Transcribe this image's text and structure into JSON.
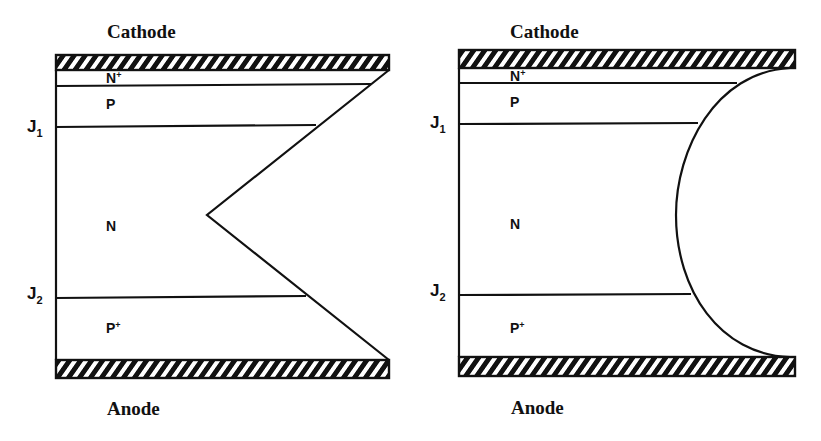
{
  "diagrams": [
    {
      "id": "bevel-positive-negative",
      "cathode_label": "Cathode",
      "anode_label": "Anode",
      "regions": {
        "n_plus": {
          "base": "N",
          "sup": "+"
        },
        "p": {
          "base": "P",
          "sup": ""
        },
        "n": {
          "base": "N",
          "sup": ""
        },
        "p_plus": {
          "base": "P",
          "sup": "+"
        }
      },
      "junctions": {
        "j1": {
          "base": "J",
          "sub": "1"
        },
        "j2": {
          "base": "J",
          "sub": "2"
        }
      },
      "edge_profile": "double-bevel (V-shaped)"
    },
    {
      "id": "contoured-edge",
      "cathode_label": "Cathode",
      "anode_label": "Anode",
      "regions": {
        "n_plus": {
          "base": "N",
          "sup": "+"
        },
        "p": {
          "base": "P",
          "sup": ""
        },
        "n": {
          "base": "N",
          "sup": ""
        },
        "p_plus": {
          "base": "P",
          "sup": "+"
        }
      },
      "junctions": {
        "j1": {
          "base": "J",
          "sub": "1"
        },
        "j2": {
          "base": "J",
          "sub": "2"
        }
      },
      "edge_profile": "curved (contoured)"
    }
  ],
  "colors": {
    "stroke": "#111111",
    "background": "#ffffff"
  }
}
